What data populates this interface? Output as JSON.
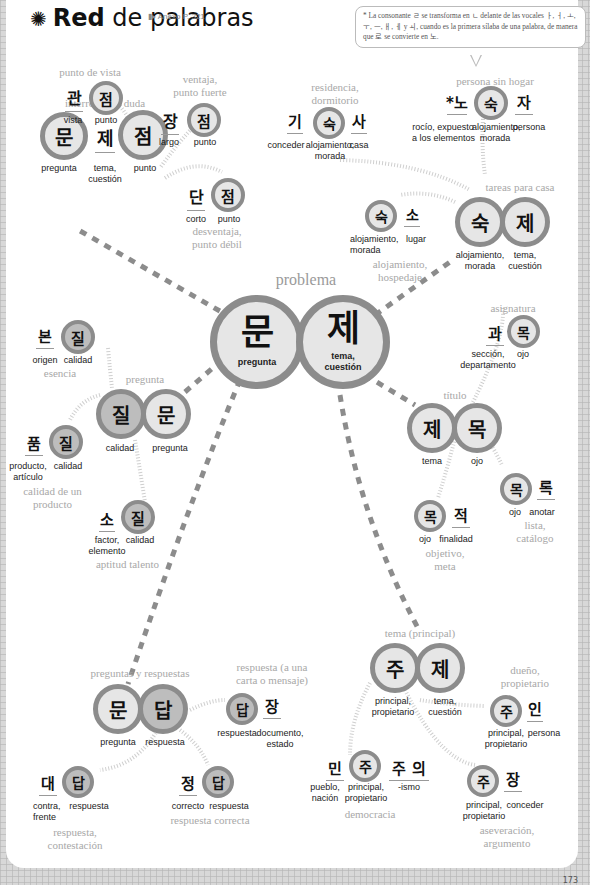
{
  "header": {
    "title_bold": "Red",
    "title_rest": " de palabras",
    "icon": "spider-web-icon",
    "annex": "Anexo P. 321"
  },
  "note": "* La consonante ㄹ se transforma en ㄴ delante de las vocales ㅏ, ㅓ, ㅗ, ㅜ, ㅡ, ㅐ, ㅔ y ㅚ, cuando es la primera sílaba de una palabra, de manera que 로 se convierte en 노.",
  "center": {
    "meaning": "problema",
    "syllables": [
      {
        "hangul": "문",
        "gloss": "pregunta"
      },
      {
        "hangul": "제",
        "gloss": "tema,\ncuestión"
      }
    ]
  },
  "groups": {
    "munjeom": {
      "meaning": "interrogante, duda",
      "syllables": [
        {
          "hangul": "문",
          "gloss": "pregunta"
        },
        {
          "hangul": "제",
          "gloss": "tema,\ncuestión"
        },
        {
          "hangul": "점",
          "gloss": "punto"
        }
      ]
    },
    "gwanjeom": {
      "meaning": "punto de vista",
      "syllables": [
        {
          "hangul": "관",
          "gloss": "vista"
        },
        {
          "hangul": "점",
          "gloss": "punto"
        }
      ]
    },
    "jangjeom": {
      "meaning": "ventaja,\npunto fuerte",
      "syllables": [
        {
          "hangul": "장",
          "gloss": "largo"
        },
        {
          "hangul": "점",
          "gloss": "punto"
        }
      ]
    },
    "danjeom": {
      "meaning": "desventaja,\npunto débil",
      "syllables": [
        {
          "hangul": "단",
          "gloss": "corto"
        },
        {
          "hangul": "점",
          "gloss": "punto"
        }
      ]
    },
    "gisuksa": {
      "meaning": "residencia,\ndormitorio",
      "syllables": [
        {
          "hangul": "기",
          "gloss": "conceder"
        },
        {
          "hangul": "숙",
          "gloss": "alojamiento,\nmorada"
        },
        {
          "hangul": "사",
          "gloss": "casa"
        }
      ]
    },
    "nosukja": {
      "meaning": "persona sin hogar",
      "syllables": [
        {
          "hangul": "*노",
          "gloss": "rocío, expuesto\na los elementos"
        },
        {
          "hangul": "숙",
          "gloss": "alojamiento,\nmorada"
        },
        {
          "hangul": "자",
          "gloss": "persona"
        }
      ]
    },
    "sukso": {
      "meaning": "alojamiento,\nhospedaje",
      "syllables": [
        {
          "hangul": "숙",
          "gloss": "alojamiento,\nmorada"
        },
        {
          "hangul": "소",
          "gloss": "lugar"
        }
      ]
    },
    "sukje": {
      "meaning": "tareas para casa",
      "syllables": [
        {
          "hangul": "숙",
          "gloss": "alojamiento,\nmorada"
        },
        {
          "hangul": "제",
          "gloss": "tema,\ncuestión"
        }
      ]
    },
    "bonjil": {
      "meaning": "esencia",
      "syllables": [
        {
          "hangul": "본",
          "gloss": "origen"
        },
        {
          "hangul": "질",
          "gloss": "calidad"
        }
      ]
    },
    "jilmun": {
      "meaning": "pregunta",
      "syllables": [
        {
          "hangul": "질",
          "gloss": "calidad"
        },
        {
          "hangul": "문",
          "gloss": "pregunta"
        }
      ]
    },
    "pumjil": {
      "meaning": "calidad de un\nproducto",
      "syllables": [
        {
          "hangul": "품",
          "gloss": "producto,\nartículo"
        },
        {
          "hangul": "질",
          "gloss": "calidad"
        }
      ]
    },
    "sojil": {
      "meaning": "aptitud talento",
      "syllables": [
        {
          "hangul": "소",
          "gloss": "factor,\nelemento"
        },
        {
          "hangul": "질",
          "gloss": "calidad"
        }
      ]
    },
    "gwamok": {
      "meaning": "asignatura",
      "syllables": [
        {
          "hangul": "과",
          "gloss": "sección,\ndepartamento"
        },
        {
          "hangul": "목",
          "gloss": "ojo"
        }
      ]
    },
    "jemok": {
      "meaning": "título",
      "syllables": [
        {
          "hangul": "제",
          "gloss": "tema"
        },
        {
          "hangul": "목",
          "gloss": "ojo"
        }
      ]
    },
    "mokjeok": {
      "meaning": "objetivo,\nmeta",
      "syllables": [
        {
          "hangul": "목",
          "gloss": "ojo"
        },
        {
          "hangul": "적",
          "gloss": "finalidad"
        }
      ]
    },
    "mongnok": {
      "meaning": "lista,\ncatálogo",
      "syllables": [
        {
          "hangul": "목",
          "gloss": "ojo"
        },
        {
          "hangul": "록",
          "gloss": "anotar"
        }
      ]
    },
    "mundap": {
      "meaning": "preguntas y respuestas",
      "syllables": [
        {
          "hangul": "문",
          "gloss": "pregunta"
        },
        {
          "hangul": "답",
          "gloss": "respuesta"
        }
      ]
    },
    "dapjang": {
      "meaning": "respuesta (a una\ncarta o mensaje)",
      "syllables": [
        {
          "hangul": "답",
          "gloss": "respuesta"
        },
        {
          "hangul": "장",
          "gloss": "documento,\nestado"
        }
      ]
    },
    "daedap": {
      "meaning": "respuesta,\ncontestación",
      "syllables": [
        {
          "hangul": "대",
          "gloss": "contra,\nfrente"
        },
        {
          "hangul": "답",
          "gloss": "respuesta"
        }
      ]
    },
    "jeongdap": {
      "meaning": "respuesta correcta",
      "syllables": [
        {
          "hangul": "정",
          "gloss": "correcto"
        },
        {
          "hangul": "답",
          "gloss": "respuesta"
        }
      ]
    },
    "juje": {
      "meaning": "tema (principal)",
      "syllables": [
        {
          "hangul": "주",
          "gloss": "principal,\npropietario"
        },
        {
          "hangul": "제",
          "gloss": "tema,\ncuestión"
        }
      ]
    },
    "juin": {
      "meaning": "dueño,\npropietario",
      "syllables": [
        {
          "hangul": "주",
          "gloss": "principal,\npropietario"
        },
        {
          "hangul": "인",
          "gloss": "persona"
        }
      ]
    },
    "minjuju": {
      "meaning": "democracia",
      "syllables": [
        {
          "hangul": "민",
          "gloss": "pueblo,\nnación"
        },
        {
          "hangul": "주",
          "gloss": "principal,\npropietario"
        },
        {
          "hangul": "주 의",
          "gloss": "-ismo"
        }
      ]
    },
    "jujang": {
      "meaning": "aseveración,\nargumento",
      "syllables": [
        {
          "hangul": "주",
          "gloss": "principal,\npropietario"
        },
        {
          "hangul": "장",
          "gloss": "conceder"
        }
      ]
    }
  },
  "colors": {
    "ring": "#8c8c8c",
    "fill_light": "#e6e6e6",
    "fill_dark": "#bdbdbd",
    "meaning_text": "#a8a8a8",
    "dashed_link": "#8c8c8c",
    "dotted_link": "#cfcfcf"
  },
  "page_number": "173"
}
